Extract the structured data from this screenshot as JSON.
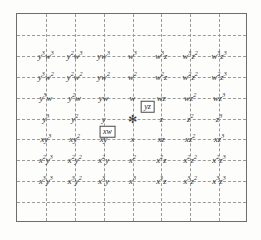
{
  "diagram": {
    "frame": {
      "border_color": "#6e6e6e",
      "grid_color": "#9a9a9a",
      "background": "#fdfdfc"
    },
    "origin_marker": {
      "name": "origin-star",
      "glyph": "✻"
    },
    "columns": 7,
    "rows": 7,
    "grid": {
      "horizontal_lines": 9,
      "vertical_lines": 7,
      "style": "dashed"
    },
    "rows_data": [
      {
        "row_index": 0,
        "cells": [
          {
            "base": "y",
            "exp": "3",
            "base2": "w",
            "exp2": "3"
          },
          {
            "base": "y",
            "exp": "2",
            "base2": "w",
            "exp2": "3"
          },
          {
            "base": "y",
            "exp": "",
            "base2": "w",
            "exp2": "3"
          },
          {
            "base": "w",
            "exp": "3",
            "base2": "",
            "exp2": ""
          },
          {
            "base": "w",
            "exp": "3",
            "base2": "z",
            "exp2": ""
          },
          {
            "base": "w",
            "exp": "3",
            "base2": "z",
            "exp2": "2"
          },
          {
            "base": "w",
            "exp": "3",
            "base2": "z",
            "exp2": "3"
          }
        ]
      },
      {
        "row_index": 1,
        "cells": [
          {
            "base": "y",
            "exp": "3",
            "base2": "w",
            "exp2": "2"
          },
          {
            "base": "y",
            "exp": "2",
            "base2": "w",
            "exp2": "2"
          },
          {
            "base": "y",
            "exp": "",
            "base2": "w",
            "exp2": "2"
          },
          {
            "base": "w",
            "exp": "2",
            "base2": "",
            "exp2": ""
          },
          {
            "base": "w",
            "exp": "2",
            "base2": "z",
            "exp2": ""
          },
          {
            "base": "w",
            "exp": "2",
            "base2": "z",
            "exp2": "2"
          },
          {
            "base": "w",
            "exp": "2",
            "base2": "z",
            "exp2": "3"
          }
        ]
      },
      {
        "row_index": 2,
        "cells": [
          {
            "base": "y",
            "exp": "3",
            "base2": "w",
            "exp2": ""
          },
          {
            "base": "y",
            "exp": "2",
            "base2": "w",
            "exp2": ""
          },
          {
            "base": "y",
            "exp": "",
            "base2": "w",
            "exp2": ""
          },
          {
            "base": "w",
            "exp": "",
            "base2": "",
            "exp2": ""
          },
          {
            "base": "w",
            "exp": "",
            "base2": "z",
            "exp2": ""
          },
          {
            "base": "w",
            "exp": "",
            "base2": "z",
            "exp2": "2"
          },
          {
            "base": "w",
            "exp": "",
            "base2": "z",
            "exp2": "3"
          }
        ]
      },
      {
        "row_index": 3,
        "cells": [
          {
            "base": "y",
            "exp": "3",
            "base2": "",
            "exp2": ""
          },
          {
            "base": "y",
            "exp": "2",
            "base2": "",
            "exp2": ""
          },
          {
            "base": "y",
            "exp": "",
            "base2": "",
            "exp2": ""
          },
          {
            "base": "",
            "exp": "",
            "base2": "",
            "exp2": ""
          },
          {
            "base": "z",
            "exp": "",
            "base2": "",
            "exp2": ""
          },
          {
            "base": "z",
            "exp": "2",
            "base2": "",
            "exp2": ""
          },
          {
            "base": "z",
            "exp": "3",
            "base2": "",
            "exp2": ""
          }
        ]
      },
      {
        "row_index": 4,
        "cells": [
          {
            "base": "x",
            "exp": "",
            "base2": "y",
            "exp2": "3"
          },
          {
            "base": "x",
            "exp": "",
            "base2": "y",
            "exp2": "2"
          },
          {
            "base": "x",
            "exp": "",
            "base2": "y",
            "exp2": ""
          },
          {
            "base": "x",
            "exp": "",
            "base2": "",
            "exp2": ""
          },
          {
            "base": "x",
            "exp": "",
            "base2": "z",
            "exp2": ""
          },
          {
            "base": "x",
            "exp": "",
            "base2": "z",
            "exp2": "2"
          },
          {
            "base": "x",
            "exp": "",
            "base2": "z",
            "exp2": "3"
          }
        ]
      },
      {
        "row_index": 5,
        "cells": [
          {
            "base": "x",
            "exp": "2",
            "base2": "y",
            "exp2": "3"
          },
          {
            "base": "x",
            "exp": "2",
            "base2": "y",
            "exp2": "2"
          },
          {
            "base": "x",
            "exp": "2",
            "base2": "y",
            "exp2": ""
          },
          {
            "base": "x",
            "exp": "2",
            "base2": "",
            "exp2": ""
          },
          {
            "base": "x",
            "exp": "2",
            "base2": "z",
            "exp2": ""
          },
          {
            "base": "x",
            "exp": "2",
            "base2": "z",
            "exp2": "2"
          },
          {
            "base": "x",
            "exp": "2",
            "base2": "z",
            "exp2": "3"
          }
        ]
      },
      {
        "row_index": 6,
        "cells": [
          {
            "base": "x",
            "exp": "3",
            "base2": "y",
            "exp2": "3"
          },
          {
            "base": "x",
            "exp": "3",
            "base2": "y",
            "exp2": "2"
          },
          {
            "base": "x",
            "exp": "3",
            "base2": "y",
            "exp2": ""
          },
          {
            "base": "x",
            "exp": "3",
            "base2": "",
            "exp2": ""
          },
          {
            "base": "x",
            "exp": "3",
            "base2": "z",
            "exp2": ""
          },
          {
            "base": "x",
            "exp": "3",
            "base2": "z",
            "exp2": "2"
          },
          {
            "base": "x",
            "exp": "3",
            "base2": "z",
            "exp2": "3"
          }
        ]
      }
    ],
    "annotations": [
      {
        "id": "yz-callout",
        "label": "yz"
      },
      {
        "id": "xw-callout",
        "label": "xw"
      }
    ]
  }
}
